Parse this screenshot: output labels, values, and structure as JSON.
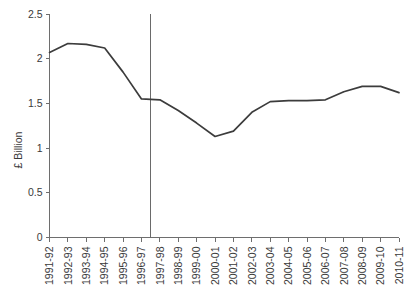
{
  "chart_data": {
    "type": "line",
    "title": "",
    "subtitle": "",
    "xlabel": "",
    "ylabel": "£ Billion",
    "ylim": [
      0,
      2.5
    ],
    "ytick_labels": [
      "0",
      "0.5",
      "1",
      "1.5",
      "2",
      "2.5"
    ],
    "ytick_values": [
      0,
      0.5,
      1,
      1.5,
      2,
      2.5
    ],
    "grid": false,
    "legend_position": "none",
    "categories": [
      "1991-92",
      "1992-93",
      "1993-94",
      "1994-95",
      "1995-96",
      "1996-97",
      "1997-98",
      "1998-99",
      "1999-00",
      "2000-01",
      "2001-02",
      "2002-03",
      "2003-04",
      "2004-05",
      "2005-06",
      "2006-07",
      "2007-08",
      "2008-09",
      "2009-10",
      "2010-11"
    ],
    "series": [
      {
        "name": "£ Billion",
        "color": "#3c3c3c",
        "values": [
          2.07,
          2.17,
          2.16,
          2.12,
          1.85,
          1.55,
          1.54,
          1.42,
          1.28,
          1.13,
          1.19,
          1.4,
          1.52,
          1.53,
          1.53,
          1.54,
          1.63,
          1.69,
          1.69,
          1.62
        ]
      }
    ],
    "annotations": [
      {
        "type": "vertical-reference-line",
        "label": "",
        "x_between": [
          "1996-97",
          "1997-98"
        ],
        "x_value": 5.5,
        "color": "#6a6a6a"
      }
    ]
  }
}
